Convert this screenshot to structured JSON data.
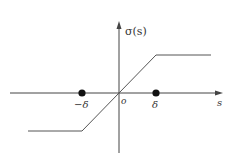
{
  "diagram": {
    "type": "saturation-function",
    "colors": {
      "axis": "#444444",
      "curve": "#555555",
      "point": "#111111",
      "text": "#333333"
    },
    "labels": {
      "y_axis": "σ(s)",
      "x_axis": "s",
      "origin": "o",
      "neg_delta": "−δ",
      "pos_delta": "δ"
    },
    "points": [
      {
        "name": "neg-delta-point",
        "label": "−δ"
      },
      {
        "name": "pos-delta-point",
        "label": "δ"
      }
    ],
    "curve": {
      "description": "Saturation function: constant negative level for s < −δ, linear through origin for −δ ≤ s ≤ δ, constant positive level for s > δ",
      "segments": [
        "lower-saturation",
        "linear-region",
        "upper-saturation"
      ]
    }
  }
}
